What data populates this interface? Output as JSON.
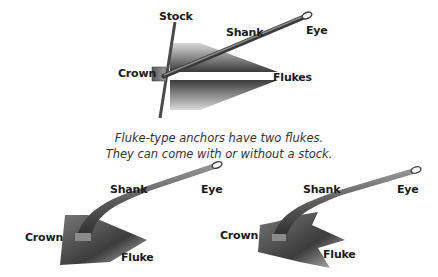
{
  "diagram": {
    "top_anchor": {
      "labels": {
        "stock": "Stock",
        "shank": "Shank",
        "eye": "Eye",
        "crown": "Crown",
        "flukes": "Flukes"
      }
    },
    "caption": {
      "line1": "Fluke-type anchors have two flukes.",
      "line2": "They can come with or without a stock."
    },
    "left_anchor": {
      "labels": {
        "shank": "Shank",
        "eye": "Eye",
        "crown": "Crown",
        "fluke": "Fluke"
      }
    },
    "right_anchor": {
      "labels": {
        "shank": "Shank",
        "eye": "Eye",
        "crown": "Crown",
        "fluke": "Fluke"
      }
    },
    "colors": {
      "metal_dark": "#2e2e2e",
      "metal_mid": "#6a6a6a",
      "metal_light": "#c8c8c8",
      "text": "#1a1a1a"
    }
  }
}
